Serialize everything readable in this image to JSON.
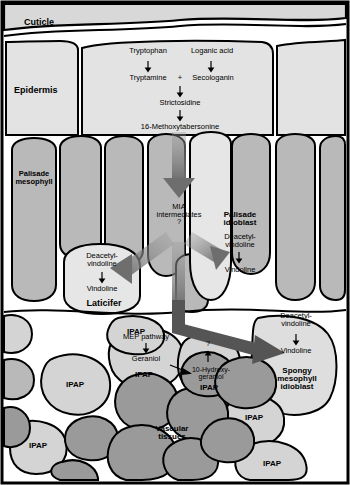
{
  "figure": {
    "width": 350,
    "height": 485
  },
  "colors": {
    "cuticle_fill": "#d8d8d8",
    "epidermis_fill": "#e3e3e3",
    "palisade_fill": "#b9b9b9",
    "idioblast_fill": "#e6e6e6",
    "laticifer_fill": "#e6e6e6",
    "ipap_fill": "#d4d4d4",
    "vascular_fill": "#9a9a9a",
    "spongy_fill": "#dedede",
    "arrow_gray": "#6e6e6e",
    "outline": "#000000",
    "background": "#ffffff"
  },
  "tissue_labels": {
    "cuticle": "Cuticle",
    "epidermis": "Epidermis",
    "palisade_mesophyll_line1": "Palisade",
    "palisade_mesophyll_line2": "mesophyll",
    "laticifer": "Laticifer",
    "palisade_idioblast_line1": "Palisade",
    "palisade_idioblast_line2": "idioblast",
    "spongy_idioblast_line1": "Spongy",
    "spongy_idioblast_line2": "mesophyll",
    "spongy_idioblast_line3": "idioblast",
    "vascular_line1": "Vascular",
    "vascular_line2": "tissues",
    "ipap": "IPAP"
  },
  "epidermis_pathway": {
    "tryptophan": "Tryptophan",
    "loganic_acid": "Loganic acid",
    "tryptamine": "Tryptamine",
    "plus": "+",
    "secologanin": "Secologanin",
    "strictosidine": "Strictosidine",
    "methoxytabersonine": "16-Methoxytabersonine"
  },
  "transport": {
    "mia_line1": "MIA",
    "mia_line2": "intermediates",
    "mia_question": "?"
  },
  "laticifer_pathway": {
    "deacetyl_line1": "Deacetyl-",
    "deacetyl_line2": "vindoline",
    "vindoline": "Vindoline"
  },
  "palisade_idioblast_pathway": {
    "deacetyl_line1": "Deacetyl-",
    "deacetyl_line2": "vindoline",
    "vindoline": "Vindoline"
  },
  "spongy_idioblast_pathway": {
    "deacetyl_line1": "Deacetyl-",
    "deacetyl_line2": "vindoline",
    "vindoline": "Vindoline"
  },
  "ipap_pathway": {
    "mep_pathway": "MEP pathway",
    "geraniol": "Geraniol",
    "hydroxygeraniol_line1": "10-Hydroxy-",
    "hydroxygeraniol_line2": "geraniol",
    "question": "?"
  },
  "ipap_cells": [
    {
      "id": "ipap-mep",
      "label": "IPAP"
    },
    {
      "id": "ipap-hydroxy",
      "label": "IPAP"
    },
    {
      "id": "ipap-midleft",
      "label": "IPAP"
    },
    {
      "id": "ipap-topright",
      "label": "IPAP"
    },
    {
      "id": "ipap-right",
      "label": "IPAP"
    },
    {
      "id": "ipap-bottomleft",
      "label": "IPAP"
    },
    {
      "id": "ipap-bottomright",
      "label": "IPAP"
    }
  ]
}
